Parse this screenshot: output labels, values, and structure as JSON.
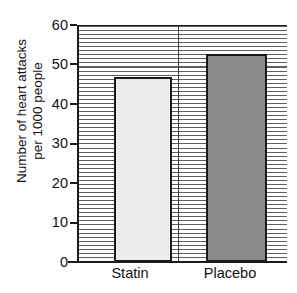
{
  "chart_data": {
    "type": "bar",
    "title": "",
    "categories": [
      "Statin",
      "Placebo"
    ],
    "values": [
      47,
      53
    ],
    "xlabel": "",
    "ylabel": "Number of heart attacks\nper 1000 people",
    "ylim": [
      0,
      60
    ],
    "ytick_labels": [
      "60",
      "50",
      "40",
      "30",
      "20",
      "10",
      "0"
    ],
    "ytick_values": [
      60,
      50,
      40,
      30,
      20,
      10,
      0
    ],
    "ytick_interval": 10,
    "grid": "horizontal-dense",
    "legend": "none",
    "bar_colors": [
      "#ececec",
      "#8a8a8a"
    ],
    "bar_edge_color": "#1a1a1a",
    "axis_color": "#1a1a1a",
    "gridline_color": "#5e5e5e",
    "background_color": "#ffffff",
    "series": [
      {
        "name": "Statin",
        "value": 47,
        "color": "#ececec"
      },
      {
        "name": "Placebo",
        "value": 53,
        "color": "#8a8a8a"
      }
    ]
  },
  "axis": {
    "y_title_text": "Number of heart attacks\nper 1000 people"
  }
}
